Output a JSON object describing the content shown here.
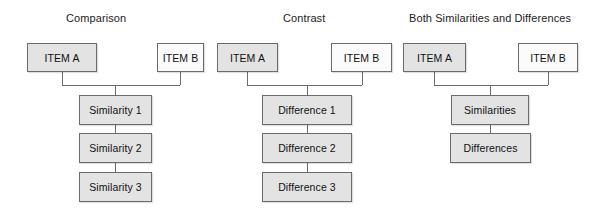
{
  "figure": {
    "background_color": "#ffffff",
    "box_border_color": "#6b6b6b",
    "box_fill_gray": "#e3e3e3",
    "box_fill_white": "#fbfbfb",
    "connector_color": "#6b6b6b"
  },
  "columns": [
    {
      "id": "comparison",
      "title": "Comparison",
      "title_x": 66,
      "title_y": 11,
      "items": [
        {
          "label": "ITEM A",
          "x": 27,
          "y": 43,
          "w": 70,
          "h": 29,
          "fill": "gray"
        },
        {
          "label": "ITEM B",
          "x": 157,
          "y": 43,
          "w": 47,
          "h": 29,
          "fill": "white"
        }
      ],
      "children": [
        {
          "label": "Similarity 1",
          "x": 79,
          "y": 95,
          "w": 73,
          "h": 30,
          "fill": "gray"
        },
        {
          "label": "Similarity 2",
          "x": 79,
          "y": 133,
          "w": 73,
          "h": 30,
          "fill": "gray"
        },
        {
          "label": "Similarity 3",
          "x": 79,
          "y": 172,
          "w": 73,
          "h": 30,
          "fill": "gray"
        }
      ],
      "connectors": {
        "left_stem_x": 62,
        "right_stem_x": 180,
        "bar_y": 85,
        "center_x": 115.5,
        "stem_top_y": 72,
        "stem_bottom_y": 95
      }
    },
    {
      "id": "contrast",
      "title": "Contrast",
      "title_x": 283,
      "title_y": 11,
      "items": [
        {
          "label": "ITEM A",
          "x": 217,
          "y": 43,
          "w": 61,
          "h": 29,
          "fill": "gray"
        },
        {
          "label": "ITEM B",
          "x": 331,
          "y": 43,
          "w": 61,
          "h": 29,
          "fill": "white"
        }
      ],
      "children": [
        {
          "label": "Difference 1",
          "x": 262,
          "y": 95,
          "w": 90,
          "h": 30,
          "fill": "gray"
        },
        {
          "label": "Difference 2",
          "x": 262,
          "y": 133,
          "w": 90,
          "h": 30,
          "fill": "gray"
        },
        {
          "label": "Difference 3",
          "x": 262,
          "y": 172,
          "w": 90,
          "h": 30,
          "fill": "gray"
        }
      ],
      "connectors": {
        "left_stem_x": 247,
        "right_stem_x": 362,
        "bar_y": 85,
        "center_x": 307,
        "stem_top_y": 72,
        "stem_bottom_y": 95
      }
    },
    {
      "id": "both",
      "title": "Both Similarities and Differences",
      "title_x": 409,
      "title_y": 11,
      "items": [
        {
          "label": "ITEM A",
          "x": 403,
          "y": 43,
          "w": 63,
          "h": 29,
          "fill": "gray"
        },
        {
          "label": "ITEM B",
          "x": 518,
          "y": 43,
          "w": 60,
          "h": 29,
          "fill": "white"
        }
      ],
      "children": [
        {
          "label": "Similarities",
          "x": 451,
          "y": 95,
          "w": 78,
          "h": 30,
          "fill": "gray"
        },
        {
          "label": "Differences",
          "x": 450,
          "y": 133,
          "w": 81,
          "h": 30,
          "fill": "gray"
        }
      ],
      "connectors": {
        "left_stem_x": 434,
        "right_stem_x": 548,
        "bar_y": 85,
        "center_x": 490,
        "stem_top_y": 72,
        "stem_bottom_y": 95
      }
    }
  ],
  "child_links": [
    {
      "x": 115.5,
      "y1": 125,
      "y2": 133
    },
    {
      "x": 115.5,
      "y1": 163,
      "y2": 172
    },
    {
      "x": 307,
      "y1": 125,
      "y2": 133
    },
    {
      "x": 307,
      "y1": 163,
      "y2": 172
    },
    {
      "x": 490,
      "y1": 125,
      "y2": 133
    }
  ]
}
